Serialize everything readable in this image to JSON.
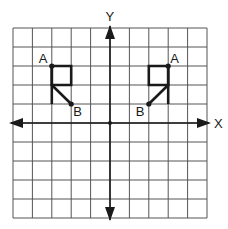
{
  "diagram": {
    "type": "coordinate-grid-reflection",
    "grid": {
      "x_min": -5,
      "x_max": 5,
      "y_min": -5,
      "y_max": 5,
      "step": 1,
      "line_color": "#555555",
      "background": "#ffffff"
    },
    "axes": {
      "x_label": "X",
      "y_label": "Y",
      "color": "#1a1a1a"
    },
    "figures": [
      {
        "name": "left-figure",
        "square": [
          [
            -3,
            3
          ],
          [
            -2,
            3
          ],
          [
            -2,
            2
          ],
          [
            -3,
            2
          ]
        ],
        "stem": [
          [
            -3,
            3
          ],
          [
            -3,
            1
          ]
        ],
        "diagonal": [
          [
            -3,
            2
          ],
          [
            -2,
            1
          ]
        ],
        "points": [
          {
            "label": "A",
            "x": -3,
            "y": 3
          },
          {
            "label": "B",
            "x": -2,
            "y": 1
          }
        ]
      },
      {
        "name": "right-figure",
        "square": [
          [
            3,
            3
          ],
          [
            2,
            3
          ],
          [
            2,
            2
          ],
          [
            3,
            2
          ]
        ],
        "stem": [
          [
            3,
            3
          ],
          [
            3,
            1
          ]
        ],
        "diagonal": [
          [
            3,
            2
          ],
          [
            2,
            1
          ]
        ],
        "points": [
          {
            "label": "A",
            "x": 3,
            "y": 3
          },
          {
            "label": "B",
            "x": 2,
            "y": 1
          }
        ]
      }
    ],
    "origin_dot": true,
    "stroke_color": "#1a1a1a"
  }
}
